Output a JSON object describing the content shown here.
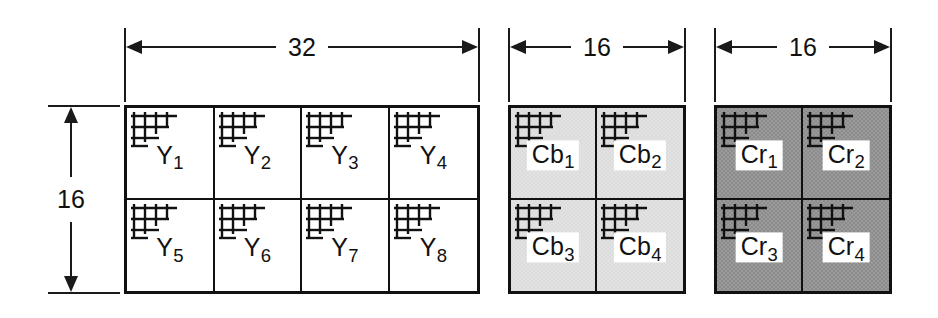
{
  "diagram": {
    "colors": {
      "line": "#111111",
      "luma_fill": "#ffffff",
      "cb_fill": "#dcdcdc",
      "cr_fill": "#8c8c8c"
    }
  },
  "dimensions": {
    "luma_width": "32",
    "cb_width": "16",
    "cr_width": "16",
    "height": "16"
  },
  "groups": [
    {
      "id": "luma",
      "component": "Y",
      "columns": 4,
      "rows": 2,
      "blocks": [
        {
          "label": "Y",
          "index": "1"
        },
        {
          "label": "Y",
          "index": "2"
        },
        {
          "label": "Y",
          "index": "3"
        },
        {
          "label": "Y",
          "index": "4"
        },
        {
          "label": "Y",
          "index": "5"
        },
        {
          "label": "Y",
          "index": "6"
        },
        {
          "label": "Y",
          "index": "7"
        },
        {
          "label": "Y",
          "index": "8"
        }
      ]
    },
    {
      "id": "cb",
      "component": "Cb",
      "columns": 2,
      "rows": 2,
      "blocks": [
        {
          "label": "Cb",
          "index": "1"
        },
        {
          "label": "Cb",
          "index": "2"
        },
        {
          "label": "Cb",
          "index": "3"
        },
        {
          "label": "Cb",
          "index": "4"
        }
      ]
    },
    {
      "id": "cr",
      "component": "Cr",
      "columns": 2,
      "rows": 2,
      "blocks": [
        {
          "label": "Cr",
          "index": "1"
        },
        {
          "label": "Cr",
          "index": "2"
        },
        {
          "label": "Cr",
          "index": "3"
        },
        {
          "label": "Cr",
          "index": "4"
        }
      ]
    }
  ]
}
